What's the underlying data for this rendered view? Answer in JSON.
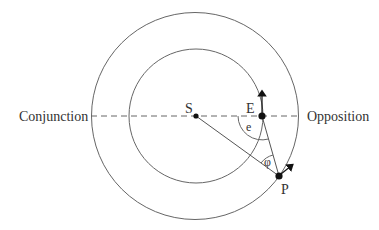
{
  "diagram": {
    "type": "orbital-geometry",
    "labels": {
      "sun": "S",
      "earth": "E",
      "planet": "P",
      "conjunction": "Conjunction",
      "opposition": "Opposition",
      "elongation_angle": "e",
      "phase_angle": "φ"
    },
    "colors": {
      "line": "#666666",
      "dot": "#111111",
      "text": "#333333"
    },
    "orbits": [
      {
        "name": "inner-orbit",
        "body": "E"
      },
      {
        "name": "outer-orbit",
        "body": "P"
      }
    ]
  }
}
